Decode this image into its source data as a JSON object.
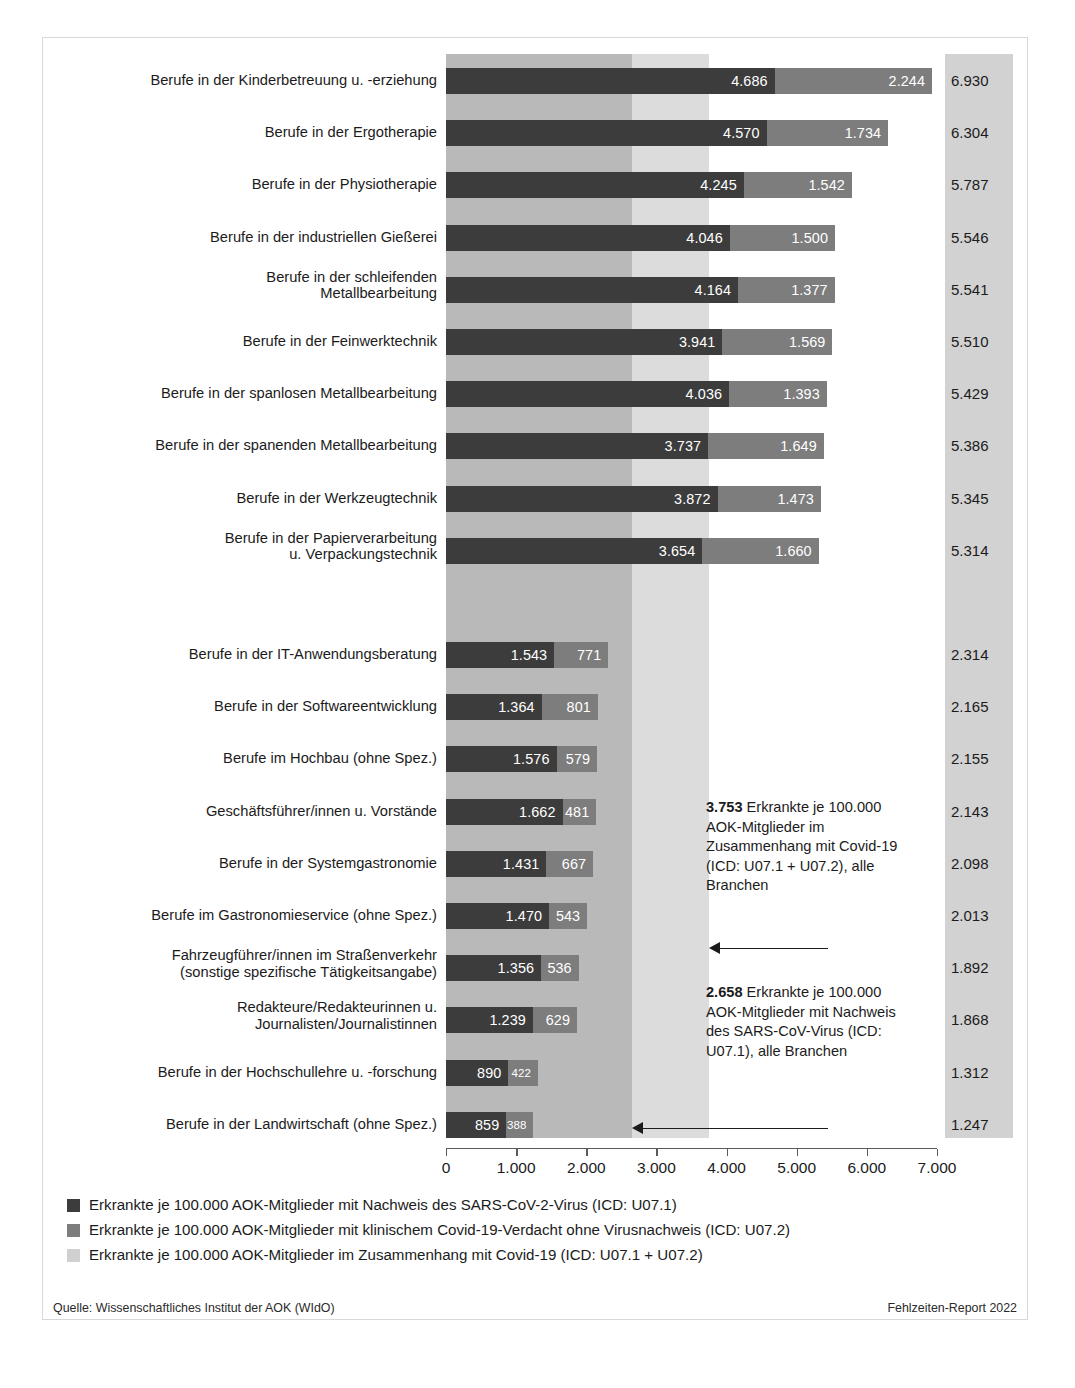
{
  "chart_data": {
    "type": "bar",
    "orientation": "horizontal",
    "stacked": true,
    "title": "",
    "xlabel": "",
    "ylabel": "",
    "xlim": [
      0,
      7000
    ],
    "xticks": [
      "0",
      "1.000",
      "2.000",
      "3.000",
      "4.000",
      "5.000",
      "6.000",
      "7.000"
    ],
    "xtick_values": [
      0,
      1000,
      2000,
      3000,
      4000,
      5000,
      6000,
      7000
    ],
    "grid": false,
    "legend_position": "below",
    "series": [
      {
        "name": "Erkrankte je 100.000 AOK-Mitglieder mit Nachweis des SARS-CoV-2-Virus (ICD: U07.1)",
        "color": "#3c3c3c",
        "values": [
          4686,
          4570,
          4245,
          4046,
          4164,
          3941,
          4036,
          3737,
          3872,
          3654,
          null,
          1543,
          1364,
          1576,
          1662,
          1431,
          1470,
          1356,
          1239,
          890,
          859
        ]
      },
      {
        "name": "Erkrankte je 100.000 AOK-Mitglieder mit klinischem Covid-19-Verdacht ohne Virusnachweis (ICD: U07.2)",
        "color": "#7d7d7d",
        "values": [
          2244,
          1734,
          1542,
          1500,
          1377,
          1569,
          1393,
          1649,
          1473,
          1660,
          null,
          771,
          801,
          579,
          481,
          667,
          543,
          536,
          629,
          422,
          388
        ]
      }
    ],
    "categories": [
      "Berufe in der Kinderbetreuung u. -erziehung",
      "Berufe in der Ergotherapie",
      "Berufe in der Physiotherapie",
      "Berufe in der industriellen Gießerei",
      "Berufe in der schleifenden\nMetallbearbeitung",
      "Berufe in der Feinwerktechnik",
      "Berufe in der spanlosen Metallbearbeitung",
      "Berufe in der spanenden Metallbearbeitung",
      "Berufe in der Werkzeugtechnik",
      "Berufe in der Papierverarbeitung\nu. Verpackungstechnik",
      "",
      "Berufe in der IT-Anwendungsberatung",
      "Berufe in der Softwareentwicklung",
      "Berufe im Hochbau (ohne Spez.)",
      "Geschäftsführer/innen u. Vorstände",
      "Berufe in der Systemgastronomie",
      "Berufe im Gastronomieservice (ohne Spez.)",
      "Fahrzeugführer/innen im Straßenverkehr\n(sonstige spezifische Tätigkeitsangabe)",
      "Redakteure/Redakteurinnen u.\nJournalisten/Journalistinnen",
      "Berufe in der Hochschullehre u. -forschung",
      "Berufe in der Landwirtschaft (ohne Spez.)"
    ],
    "totals": [
      "6.930",
      "6.304",
      "5.787",
      "5.546",
      "5.541",
      "5.510",
      "5.429",
      "5.386",
      "5.345",
      "5.314",
      "",
      "2.314",
      "2.165",
      "2.155",
      "2.143",
      "2.098",
      "2.013",
      "1.892",
      "1.868",
      "1.312",
      "1.247"
    ],
    "total_values": [
      6930,
      6304,
      5787,
      5546,
      5541,
      5510,
      5429,
      5386,
      5345,
      5314,
      null,
      2314,
      2165,
      2155,
      2143,
      2098,
      2013,
      1892,
      1868,
      1312,
      1247
    ],
    "bars": [
      {
        "category": "Berufe in der Kinderbetreuung u. -erziehung",
        "u071": 4686,
        "u072": 2244,
        "total": 6930,
        "u071_label": "4.686",
        "u072_label": "2.244",
        "total_label": "6.930"
      },
      {
        "category": "Berufe in der Ergotherapie",
        "u071": 4570,
        "u072": 1734,
        "total": 6304,
        "u071_label": "4.570",
        "u072_label": "1.734",
        "total_label": "6.304"
      },
      {
        "category": "Berufe in der Physiotherapie",
        "u071": 4245,
        "u072": 1542,
        "total": 5787,
        "u071_label": "4.245",
        "u072_label": "1.542",
        "total_label": "5.787"
      },
      {
        "category": "Berufe in der industriellen Gießerei",
        "u071": 4046,
        "u072": 1500,
        "total": 5546,
        "u071_label": "4.046",
        "u072_label": "1.500",
        "total_label": "5.546"
      },
      {
        "category": "Berufe in der schleifenden\nMetallbearbeitung",
        "u071": 4164,
        "u072": 1377,
        "total": 5541,
        "u071_label": "4.164",
        "u072_label": "1.377",
        "total_label": "5.541"
      },
      {
        "category": "Berufe in der Feinwerktechnik",
        "u071": 3941,
        "u072": 1569,
        "total": 5510,
        "u071_label": "3.941",
        "u072_label": "1.569",
        "total_label": "5.510"
      },
      {
        "category": "Berufe in der spanlosen Metallbearbeitung",
        "u071": 4036,
        "u072": 1393,
        "total": 5429,
        "u071_label": "4.036",
        "u072_label": "1.393",
        "total_label": "5.429"
      },
      {
        "category": "Berufe in der spanenden Metallbearbeitung",
        "u071": 3737,
        "u072": 1649,
        "total": 5386,
        "u071_label": "3.737",
        "u072_label": "1.649",
        "total_label": "5.386"
      },
      {
        "category": "Berufe in der Werkzeugtechnik",
        "u071": 3872,
        "u072": 1473,
        "total": 5345,
        "u071_label": "3.872",
        "u072_label": "1.473",
        "total_label": "5.345"
      },
      {
        "category": "Berufe in der Papierverarbeitung\nu. Verpackungstechnik",
        "u071": 3654,
        "u072": 1660,
        "total": 5314,
        "u071_label": "3.654",
        "u072_label": "1.660",
        "total_label": "5.314"
      },
      {
        "category": "Berufe in der IT-Anwendungsberatung",
        "u071": 1543,
        "u072": 771,
        "total": 2314,
        "u071_label": "1.543",
        "u072_label": "771",
        "total_label": "2.314"
      },
      {
        "category": "Berufe in der Softwareentwicklung",
        "u071": 1364,
        "u072": 801,
        "total": 2165,
        "u071_label": "1.364",
        "u072_label": "801",
        "total_label": "2.165"
      },
      {
        "category": "Berufe im Hochbau (ohne Spez.)",
        "u071": 1576,
        "u072": 579,
        "total": 2155,
        "u071_label": "1.576",
        "u072_label": "579",
        "total_label": "2.155"
      },
      {
        "category": "Geschäftsführer/innen u. Vorstände",
        "u071": 1662,
        "u072": 481,
        "total": 2143,
        "u071_label": "1.662",
        "u072_label": "481",
        "total_label": "2.143"
      },
      {
        "category": "Berufe in der Systemgastronomie",
        "u071": 1431,
        "u072": 667,
        "total": 2098,
        "u071_label": "1.431",
        "u072_label": "667",
        "total_label": "2.098"
      },
      {
        "category": "Berufe im Gastronomieservice (ohne Spez.)",
        "u071": 1470,
        "u072": 543,
        "total": 2013,
        "u071_label": "1.470",
        "u072_label": "543",
        "total_label": "2.013"
      },
      {
        "category": "Fahrzeugführer/innen im Straßenverkehr\n(sonstige spezifische Tätigkeitsangabe)",
        "u071": 1356,
        "u072": 536,
        "total": 1892,
        "u071_label": "1.356",
        "u072_label": "536",
        "total_label": "1.892"
      },
      {
        "category": "Redakteure/Redakteurinnen u.\nJournalisten/Journalistinnen",
        "u071": 1239,
        "u072": 629,
        "total": 1868,
        "u071_label": "1.239",
        "u072_label": "629",
        "total_label": "1.868"
      },
      {
        "category": "Berufe in der Hochschullehre u. -forschung",
        "u071": 890,
        "u072": 422,
        "total": 1312,
        "u071_label": "890",
        "u072_label": "422",
        "total_label": "1.312"
      },
      {
        "category": "Berufe in der Landwirtschaft (ohne Spez.)",
        "u071": 859,
        "u072": 388,
        "total": 1247,
        "u071_label": "859",
        "u072_label": "388",
        "total_label": "1.247"
      }
    ],
    "reference_bands": [
      {
        "name": "u071-all-branches",
        "value": 2658,
        "label": "2.658",
        "color": "#b9b9b9"
      },
      {
        "name": "covid-total-all-branches",
        "value": 3753,
        "label": "3.753",
        "color": "#dcdcdc"
      }
    ],
    "annotations": [
      {
        "name": "annotation-3753",
        "value_label": "3.753",
        "text": " Erkrankte je 100.000 AOK-Mitglieder im Zusammenhang mit Covid-19 (ICD: U07.1 + U07.2), alle Branchen"
      },
      {
        "name": "annotation-2658",
        "value_label": "2.658",
        "text": " Erkrankte je 100.000 AOK-Mitglieder mit Nachweis des SARS-CoV-Virus (ICD: U07.1), alle Branchen"
      }
    ]
  },
  "legend": [
    {
      "swatch": "dark",
      "label": "Erkrankte je 100.000 AOK-Mitglieder mit Nachweis des SARS-CoV-2-Virus (ICD: U07.1)",
      "color": "#3c3c3c"
    },
    {
      "swatch": "medium",
      "label": "Erkrankte je 100.000 AOK-Mitglieder mit klinischem Covid-19-Verdacht ohne Virusnachweis (ICD: U07.2)",
      "color": "#7d7d7d"
    },
    {
      "swatch": "light",
      "label": "Erkrankte je 100.000 AOK-Mitglieder im Zusammenhang mit Covid-19 (ICD: U07.1 + U07.2)",
      "color": "#d0d0d0"
    }
  ],
  "footer": {
    "source": "Quelle: Wissenschaftliches Institut der AOK (WIdO)",
    "report": "Fehlzeiten-Report 2022"
  }
}
